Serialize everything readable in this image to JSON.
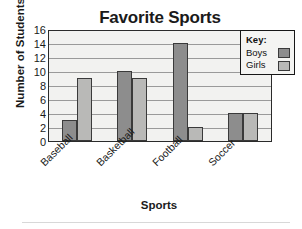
{
  "chart_data": {
    "type": "bar",
    "title": "Favorite Sports",
    "xlabel": "Sports",
    "ylabel": "Number of Students",
    "categories": [
      "Baseball",
      "Basketball",
      "Football",
      "Soccer"
    ],
    "series": [
      {
        "name": "Boys",
        "values": [
          3,
          10,
          14,
          4
        ],
        "color": "#8d8d8d"
      },
      {
        "name": "Girls",
        "values": [
          9,
          9,
          2,
          4
        ],
        "color": "#b9b9b7"
      }
    ],
    "ylim": [
      0,
      16
    ],
    "yticks": [
      0,
      2,
      4,
      6,
      8,
      10,
      12,
      14,
      16
    ],
    "ytick_labels": [
      "0",
      "2",
      "4",
      "6",
      "8",
      "10",
      "12",
      "14",
      "16"
    ],
    "grid": true,
    "grid_axis": "y",
    "legend": {
      "title": "Key:",
      "position": "top-right",
      "entries": [
        "Boys",
        "Girls"
      ]
    },
    "xtick_rotation": -45,
    "plot_background": "#f2f2f0"
  }
}
